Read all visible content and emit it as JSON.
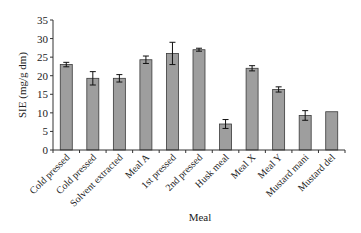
{
  "chart_data": {
    "type": "bar",
    "title": "",
    "xlabel": "Meal",
    "ylabel": "SIE (mg/g dm)",
    "ylim": [
      0,
      35
    ],
    "yticks": [
      0,
      5,
      10,
      15,
      20,
      25,
      30,
      35
    ],
    "grid": false,
    "legend": null,
    "categories": [
      "Cold pressed",
      "Cold pressed",
      "Solvent extracted",
      "Meal A",
      "1st pressed",
      "2nd pressed",
      "Husk meal",
      "Meal X",
      "Meal Y",
      "Mustard mani",
      "Mustard del"
    ],
    "values": [
      23.0,
      19.3,
      19.3,
      24.3,
      26.0,
      27.0,
      7.0,
      22.0,
      16.3,
      9.3,
      10.3
    ],
    "errors": [
      0.6,
      1.8,
      1.0,
      1.0,
      3.0,
      0.4,
      1.2,
      0.7,
      0.7,
      1.3,
      0
    ],
    "colors": {
      "bar_fill": "#9e9e9e",
      "bar_stroke": "#3a3a3a",
      "axis": "#333333",
      "text": "#222222"
    }
  }
}
